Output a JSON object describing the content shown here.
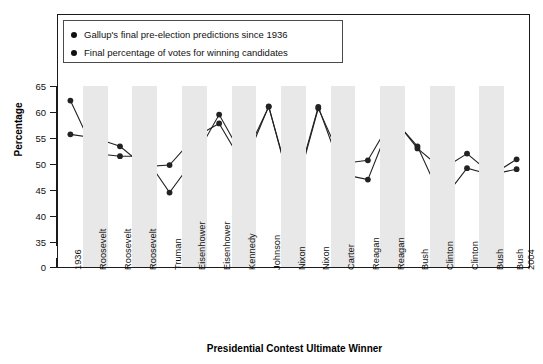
{
  "legend": {
    "items": [
      {
        "label": "Gallup's final pre-election predictions since 1936",
        "marker": "round-dot-marker"
      },
      {
        "label": "Final percentage of votes for winning candidates",
        "marker": "round-dot-marker"
      }
    ]
  },
  "axes": {
    "y_title": "Percentage",
    "x_title": "Presidential Contest Ultimate Winner",
    "y_ticks": [
      "0",
      "35",
      "40",
      "45",
      "50",
      "55",
      "60",
      "65"
    ]
  },
  "chart_data": {
    "type": "line",
    "title": "",
    "xlabel": "Presidential Contest Ultimate Winner",
    "ylabel": "Percentage",
    "ylim": [
      35,
      65
    ],
    "y_ticks": [
      0,
      35,
      40,
      45,
      50,
      55,
      60,
      65
    ],
    "axis_break": true,
    "grid": false,
    "legend_position": "top-left",
    "categories": [
      "1936",
      "Roosevelt",
      "Roosevelt",
      "Roosevelt",
      "Truman",
      "Eisenhower",
      "Eisenhower",
      "Kennedy",
      "Johnson",
      "Nixon",
      "Nixon",
      "Carter",
      "Reagan",
      "Reagan",
      "Bush",
      "Clinton",
      "Clinton",
      "Bush",
      "Bush 2004"
    ],
    "category_lines": [
      [
        "1936"
      ],
      [
        "Roosevelt"
      ],
      [
        "Roosevelt"
      ],
      [
        "Roosevelt"
      ],
      [
        "Truman"
      ],
      [
        "Eisenhower"
      ],
      [
        "Eisenhower"
      ],
      [
        "Kennedy"
      ],
      [
        "Johnson"
      ],
      [
        "Nixon"
      ],
      [
        "Nixon"
      ],
      [
        "Carter"
      ],
      [
        "Reagan"
      ],
      [
        "Reagan"
      ],
      [
        "Bush"
      ],
      [
        "Clinton"
      ],
      [
        "Clinton"
      ],
      [
        "Bush"
      ],
      [
        "Bush",
        "2004"
      ]
    ],
    "series": [
      {
        "name": "Gallup's final pre-election predictions since 1936",
        "color": "#222222",
        "values": [
          62.2,
          52.0,
          51.5,
          51.5,
          44.5,
          51.0,
          59.5,
          51.0,
          61.0,
          44.0,
          61.0,
          48.0,
          47.0,
          59.0,
          53.0,
          49.0,
          52.0,
          48.0,
          49.0
        ]
      },
      {
        "name": "Final percentage of votes for winning candidates",
        "color": "#222222",
        "values": [
          55.7,
          55.0,
          53.4,
          49.5,
          49.8,
          55.1,
          57.8,
          49.7,
          61.1,
          43.4,
          60.7,
          50.1,
          50.7,
          58.8,
          53.4,
          43.0,
          49.2,
          47.9,
          50.9
        ]
      }
    ]
  }
}
